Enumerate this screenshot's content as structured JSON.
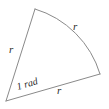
{
  "figure": {
    "kind": "circular-sector-diagram",
    "background_color": "#ffffff",
    "stroke_color": "#8a8a8a",
    "text_color": "#2b2b2b",
    "labels": {
      "radius_left": "r",
      "radius_arc": "r",
      "radius_bottom": "r",
      "angle": "1 rad"
    },
    "geometry": {
      "center_x": 6,
      "center_y": 101,
      "radius": 97,
      "arc_start_x": 35,
      "arc_start_y": 9,
      "arc_end_x": 100,
      "arc_end_y": 74,
      "angle_radians": 1,
      "stroke_width": 1
    }
  }
}
